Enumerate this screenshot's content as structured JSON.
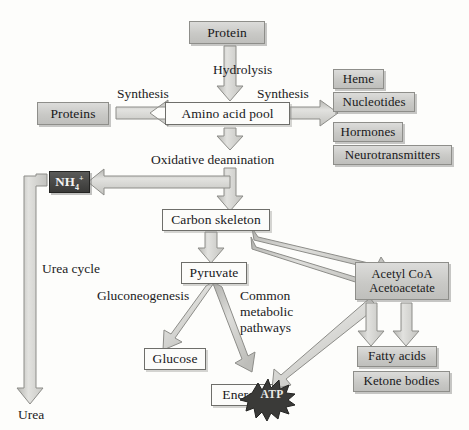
{
  "diagram": {
    "background_color": "#fdfdfb",
    "box_fill_grey": "#cccccA",
    "box_fill_plain": "#fcfcfa",
    "box_fill_dark": "#3a3a38",
    "arrow_fill": "#cfcfcc",
    "arrow_stroke": "#8a8a86"
  },
  "nodes": {
    "protein": "Protein",
    "amino_acid_pool": "Amino acid pool",
    "proteins": "Proteins",
    "heme": "Heme",
    "nucleotides": "Nucleotides",
    "hormones": "Hormones",
    "neurotransmitters": "Neurotransmitters",
    "ammonium_main": "NH",
    "ammonium_sub": "4",
    "ammonium_sup": "+",
    "carbon_skeleton": "Carbon skeleton",
    "pyruvate": "Pyruvate",
    "glucose": "Glucose",
    "energy": "Energy",
    "atp": "ATP",
    "acetyl_coa_line1": "Acetyl CoA",
    "acetyl_coa_line2": "Acetoacetate",
    "fatty_acids": "Fatty acids",
    "ketone_bodies": "Ketone bodies",
    "urea": "Urea"
  },
  "labels": {
    "hydrolysis": "Hydrolysis",
    "synthesis_left": "Synthesis",
    "synthesis_right": "Synthesis",
    "oxidative_deamination": "Oxidative deamination",
    "urea_cycle": "Urea cycle",
    "gluconeogenesis": "Gluconeogenesis",
    "common_metabolic_l1": "Common",
    "common_metabolic_l2": "metabolic",
    "common_metabolic_l3": "pathways"
  }
}
